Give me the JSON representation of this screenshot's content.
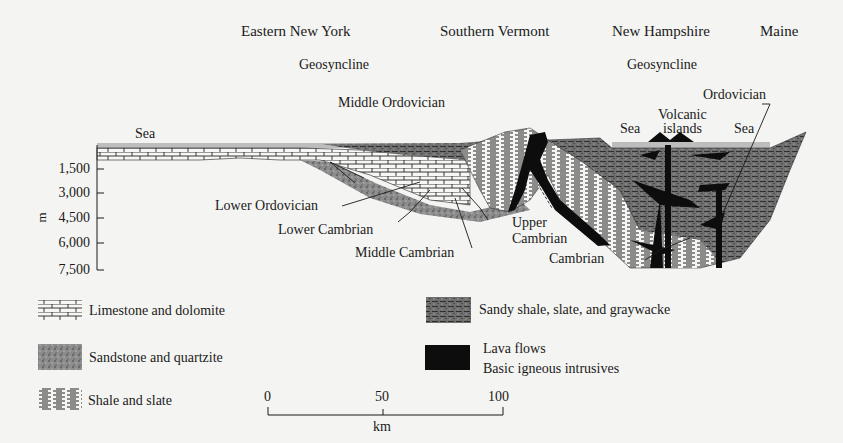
{
  "regions": [
    {
      "label": "Eastern New York"
    },
    {
      "label": "Southern Vermont"
    },
    {
      "label": "New Hampshire"
    },
    {
      "label": "Maine"
    }
  ],
  "geosynclines": [
    {
      "label": "Geosyncline",
      "region": "Eastern New York"
    },
    {
      "label": "Geosyncline",
      "region": "New Hampshire"
    }
  ],
  "surface_labels": {
    "sea_west": "Sea",
    "sea_nh_west": "Sea",
    "volcanic_islands_1": "Volcanic",
    "volcanic_islands_2": "islands",
    "sea_nh_east": "Sea"
  },
  "strata_labels": {
    "middle_ordovician": "Middle Ordovician",
    "ordovician": "Ordovician",
    "lower_ordovician": "Lower Ordovician",
    "lower_cambrian": "Lower Cambrian",
    "middle_cambrian": "Middle Cambrian",
    "upper_cambrian_1": "Upper",
    "upper_cambrian_2": "Cambrian",
    "cambrian": "Cambrian"
  },
  "depth_axis": {
    "unit": "m",
    "ticks": [
      "1,500",
      "3,000",
      "4,500",
      "6,000",
      "7,500"
    ]
  },
  "legend": [
    {
      "pattern": "limestone",
      "label": "Limestone and dolomite"
    },
    {
      "pattern": "sandstone",
      "label": "Sandstone and quartzite"
    },
    {
      "pattern": "shale",
      "label": "Shale and slate"
    },
    {
      "pattern": "sandy-shale",
      "label": "Sandy shale, slate, and graywacke"
    },
    {
      "pattern": "lava",
      "label_1": "Lava flows",
      "label_2": "Basic igneous intrusives"
    }
  ],
  "scale_bar": {
    "ticks": [
      "0",
      "50",
      "100"
    ],
    "unit": "km"
  },
  "colors": {
    "sea": "#bdbdbd",
    "sandstone": "#8a8a8a",
    "sandy_shale": "#6e6e6e",
    "lava": "#0d0d0d",
    "ink": "#1a1a1a"
  }
}
